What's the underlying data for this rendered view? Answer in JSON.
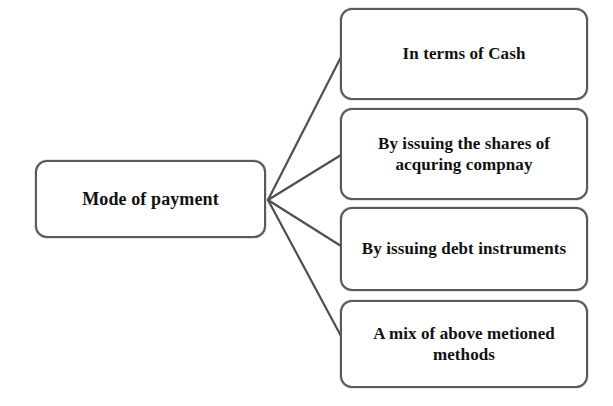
{
  "diagram": {
    "title": "Mode of payment",
    "background_color": "#ffffff",
    "line_color": "#4f4f4f",
    "border_color": "#5a5a5a",
    "text_color": "#111111",
    "root": {
      "label": "Mode of payment"
    },
    "branches": [
      {
        "label": "In terms of Cash"
      },
      {
        "label": "By issuing the shares of\nacquring compnay"
      },
      {
        "label": "By issuing debt instruments"
      },
      {
        "label": "A mix of above metioned\nmethods"
      }
    ]
  }
}
